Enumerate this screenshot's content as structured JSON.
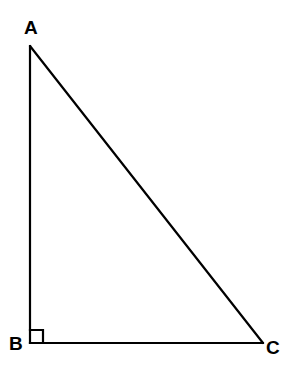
{
  "figure": {
    "type": "right-triangle-diagram",
    "background_color": "#ffffff",
    "stroke_color": "#000000",
    "stroke_width": 2.2,
    "canvas": {
      "width": 294,
      "height": 372
    },
    "vertices": [
      {
        "id": "A",
        "label": "A",
        "x": 30,
        "y": 46
      },
      {
        "id": "B",
        "label": "B",
        "x": 30,
        "y": 343
      },
      {
        "id": "C",
        "label": "C",
        "x": 263,
        "y": 343
      }
    ],
    "edges": [
      {
        "id": "AB",
        "from": "A",
        "to": "B",
        "name": "leg-vertical"
      },
      {
        "id": "BC",
        "from": "B",
        "to": "C",
        "name": "leg-horizontal"
      },
      {
        "id": "CA",
        "from": "C",
        "to": "A",
        "name": "hypotenuse"
      }
    ],
    "right_angle": {
      "at_vertex": "B",
      "marker": "square",
      "size": 13
    },
    "labels": {
      "a": "A",
      "b": "B",
      "c": "C"
    }
  }
}
